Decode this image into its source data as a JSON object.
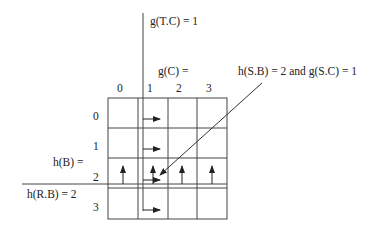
{
  "labels": {
    "g_tc": "g(T.C) = 1",
    "g_c": "g(C) =",
    "h_sb_g_sc": "h(S.B) = 2 and g(S.C) = 1",
    "h_b": "h(B) =",
    "h_rb": "h(R.B) = 2"
  },
  "columns": [
    "0",
    "1",
    "2",
    "3"
  ],
  "rows": [
    "0",
    "1",
    "2",
    "3"
  ],
  "colors": {
    "line": "#333333",
    "background": "#ffffff"
  }
}
